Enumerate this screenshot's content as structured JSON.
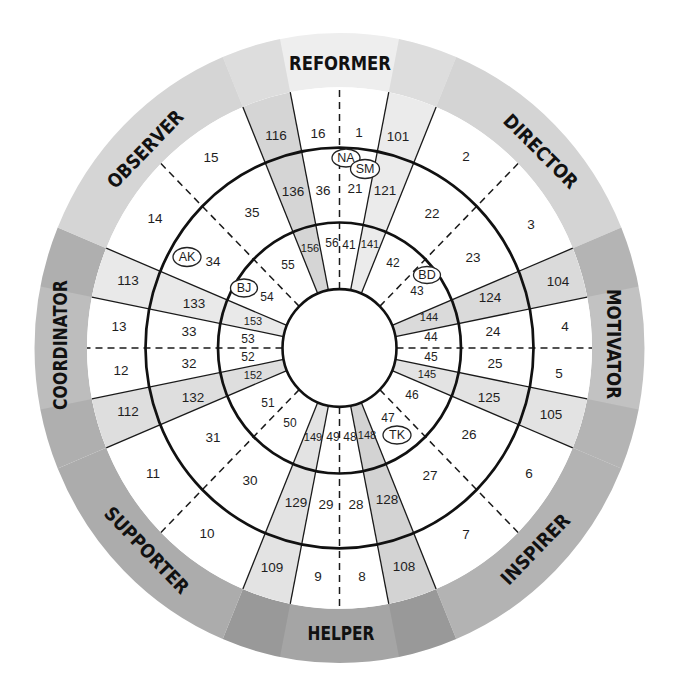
{
  "diagram": {
    "roles": [
      {
        "name": "REFORMER",
        "ring_color": "#eeeeee"
      },
      {
        "name": "DIRECTOR",
        "ring_color": "#d4d4d4"
      },
      {
        "name": "MOTIVATOR",
        "ring_color": "#c2c2c2"
      },
      {
        "name": "INSPIRER",
        "ring_color": "#b3b3b3"
      },
      {
        "name": "HELPER",
        "ring_color": "#a5a5a5"
      },
      {
        "name": "SUPPORTER",
        "ring_color": "#acacac"
      },
      {
        "name": "COORDINATOR",
        "ring_color": "#bdbdbd"
      },
      {
        "name": "OBSERVER",
        "ring_color": "#d5d5d5"
      }
    ],
    "wedges": [
      {
        "label": "101",
        "color": "#ebebeb"
      },
      {
        "label": "104",
        "color": "#dadada"
      },
      {
        "label": "105",
        "color": "#e3e3e3"
      },
      {
        "label": "108",
        "color": "#d3d3d3"
      },
      {
        "label": "109",
        "color": "#e3e3e3"
      },
      {
        "label": "112",
        "color": "#dedede"
      },
      {
        "label": "113",
        "color": "#e9e9e9"
      },
      {
        "label": "116",
        "color": "#d5d5d5"
      }
    ],
    "bands": {
      "outer": [
        "1",
        "101",
        "2",
        "3",
        "104",
        "4",
        "5",
        "105",
        "6",
        "7",
        "108",
        "8",
        "9",
        "109",
        "10",
        "11",
        "112",
        "12",
        "13",
        "113",
        "14",
        "15",
        "116",
        "16"
      ],
      "middle": [
        "21",
        "121",
        "22",
        "23",
        "124",
        "24",
        "25",
        "125",
        "26",
        "27",
        "128",
        "28",
        "29",
        "129",
        "30",
        "31",
        "132",
        "32",
        "33",
        "133",
        "34",
        "35",
        "136",
        "36"
      ],
      "inner": [
        "41",
        "141",
        "42",
        "43",
        "144",
        "44",
        "45",
        "145",
        "46",
        "47",
        "148",
        "48",
        "49",
        "149",
        "50",
        "51",
        "152",
        "52",
        "53",
        "153",
        "54",
        "55",
        "156",
        "56"
      ]
    },
    "markers": [
      {
        "initials": "NA"
      },
      {
        "initials": "SM"
      },
      {
        "initials": "AK"
      },
      {
        "initials": "BJ"
      },
      {
        "initials": "BD"
      },
      {
        "initials": "TK"
      }
    ],
    "colors": {
      "background": "#ffffff",
      "lines": "#1a1a1a",
      "center_fill": "#ffffff"
    }
  }
}
